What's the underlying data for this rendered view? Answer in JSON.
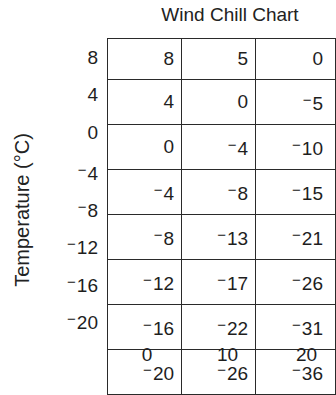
{
  "chart_data": {
    "type": "table",
    "title": "Wind Chill Chart",
    "ylabel": "Temperature (°C)",
    "xlabel": "",
    "row_labels": [
      8,
      4,
      0,
      -4,
      -8,
      -12,
      -16,
      -20
    ],
    "column_labels": [
      0,
      10,
      20
    ],
    "cells": [
      [
        8,
        5,
        0
      ],
      [
        4,
        0,
        -5
      ],
      [
        0,
        -4,
        -10
      ],
      [
        -4,
        -8,
        -15
      ],
      [
        -8,
        -13,
        -21
      ],
      [
        -12,
        -17,
        -26
      ],
      [
        -16,
        -22,
        -31
      ],
      [
        -20,
        -26,
        -36
      ]
    ],
    "grid": true
  },
  "display": {
    "title": "Wind Chill Chart",
    "ylabel": "Temperature (°C)",
    "minus_sign": "−",
    "rows": [
      {
        "label": "8",
        "cells": [
          "8",
          "5",
          "0"
        ]
      },
      {
        "label": "4",
        "cells": [
          "4",
          "0",
          "−5"
        ]
      },
      {
        "label": "0",
        "cells": [
          "0",
          "−4",
          "−10"
        ]
      },
      {
        "label": "−4",
        "cells": [
          "−4",
          "−8",
          "−15"
        ]
      },
      {
        "label": "−8",
        "cells": [
          "−8",
          "−13",
          "−21"
        ]
      },
      {
        "label": "−12",
        "cells": [
          "−12",
          "−17",
          "−26"
        ]
      },
      {
        "label": "−16",
        "cells": [
          "−16",
          "−22",
          "−31"
        ]
      },
      {
        "label": "−20",
        "cells": [
          "−20",
          "−26",
          "−36"
        ]
      }
    ],
    "columns": [
      "0",
      "10",
      "20"
    ]
  }
}
